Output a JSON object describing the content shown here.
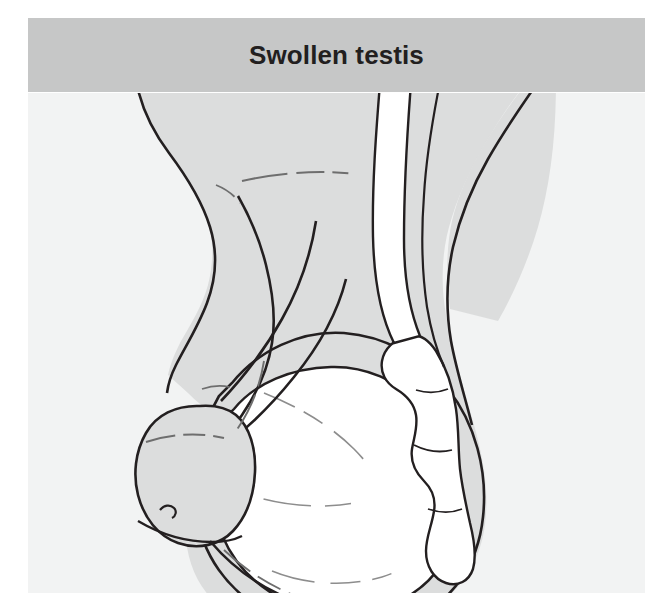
{
  "figure": {
    "title": "Swollen testis",
    "caption_banner_color": "#c6c7c7",
    "panel_background_color": "#f2f3f3",
    "body_fill_color": "#dcdddd",
    "testis_fill_color": "#ffffff",
    "line_color": "#231f20",
    "title_text_color": "#221f1f"
  },
  "illustration": {
    "type": "medical-line-drawing",
    "subject": "male external genitalia with unilateral swollen (enlarged) testis",
    "parts": [
      {
        "name": "penis-shaft",
        "label": "Penis shaft",
        "fill": "#dcdddd"
      },
      {
        "name": "glans-penis",
        "label": "Glans penis",
        "fill": "#dcdddd"
      },
      {
        "name": "scrotum",
        "label": "Scrotum",
        "fill": "#dcdddd"
      },
      {
        "name": "swollen-testis",
        "label": "Swollen testis",
        "fill": "#ffffff"
      },
      {
        "name": "epididymis",
        "label": "Epididymis",
        "fill": "#ffffff"
      },
      {
        "name": "spermatic-cord",
        "label": "Spermatic cord",
        "fill": "#ffffff"
      }
    ]
  }
}
